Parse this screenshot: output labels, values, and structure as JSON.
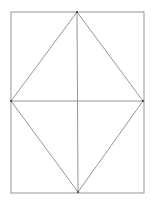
{
  "diagram": {
    "title": "",
    "colors": {
      "line": "#8a8a8a",
      "vertex": "#333333",
      "background": "#ffffff"
    },
    "shapes": [
      {
        "name": "rectangle",
        "kind": "outer-rectangle"
      },
      {
        "name": "rhombus",
        "kind": "inscribed-rhombus"
      },
      {
        "name": "vertical-midline",
        "kind": "segment"
      },
      {
        "name": "horizontal-midline",
        "kind": "segment"
      }
    ],
    "vertex_count": 4,
    "labels": []
  }
}
